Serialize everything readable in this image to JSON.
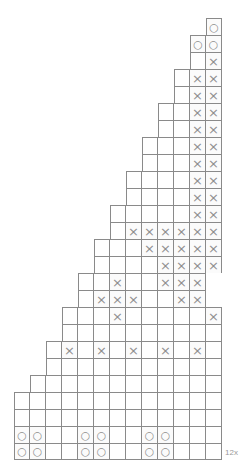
{
  "chart": {
    "title": "",
    "repeat_label": "12x",
    "columns": 13,
    "cell_px": 16,
    "row_px": 17,
    "grid_left_px": 14,
    "grid_top_px": 18,
    "colors": {
      "grid_line": "#8a8a8a",
      "symbol": "#8f8f8f",
      "label": "#9a9a9a",
      "background": "#ffffff",
      "shaded_cell": "#fbfbfb"
    },
    "symbol_legend": {
      "x": "cross-stitch-symbol",
      "o": "circle-stitch-symbol",
      "blank": "empty-cell"
    },
    "rows": [
      {
        "index": 26,
        "start_col": 12,
        "cells": [
          "o"
        ]
      },
      {
        "index": 25,
        "start_col": 11,
        "cells": [
          "o",
          "o"
        ]
      },
      {
        "index": 24,
        "start_col": 11,
        "cells": [
          "",
          "x"
        ]
      },
      {
        "index": 23,
        "start_col": 10,
        "cells": [
          "",
          "x",
          "x"
        ]
      },
      {
        "index": 22,
        "start_col": 10,
        "cells": [
          "",
          "x",
          "x"
        ]
      },
      {
        "index": 21,
        "start_col": 9,
        "cells": [
          "",
          "",
          "x",
          "x"
        ]
      },
      {
        "index": 20,
        "start_col": 9,
        "cells": [
          "",
          "",
          "x",
          "x"
        ]
      },
      {
        "index": 19,
        "start_col": 8,
        "cells": [
          "",
          "",
          "",
          "x",
          "x"
        ]
      },
      {
        "index": 18,
        "start_col": 8,
        "cells": [
          "",
          "",
          "",
          "x",
          "x"
        ]
      },
      {
        "index": 17,
        "start_col": 7,
        "cells": [
          "",
          "",
          "",
          "",
          "x",
          "x"
        ]
      },
      {
        "index": 16,
        "start_col": 7,
        "cells": [
          "",
          "",
          "",
          "",
          "x",
          "x"
        ]
      },
      {
        "index": 15,
        "start_col": 6,
        "cells": [
          "",
          "",
          "",
          "",
          "",
          "x",
          "x"
        ]
      },
      {
        "index": 14,
        "start_col": 6,
        "cells": [
          "",
          "x",
          "x",
          "x",
          "x",
          "x",
          "x"
        ]
      },
      {
        "index": 13,
        "start_col": 5,
        "cells": [
          "",
          "",
          "",
          "x",
          "x",
          "x",
          "x",
          "x"
        ]
      },
      {
        "index": 12,
        "start_col": 5,
        "cells": [
          "",
          "",
          "",
          "",
          "x",
          "x",
          "x",
          "x"
        ]
      },
      {
        "index": 11,
        "start_col": 4,
        "cells": [
          "",
          "",
          "x",
          "",
          "",
          "x",
          "x",
          "x"
        ]
      },
      {
        "index": 10,
        "start_col": 4,
        "cells": [
          "",
          "x",
          "x",
          "x",
          "",
          "",
          "x",
          "x"
        ]
      },
      {
        "index": 9,
        "start_col": 3,
        "cells": [
          "",
          "",
          "",
          "x",
          "",
          "",
          "",
          "",
          "",
          "x"
        ]
      },
      {
        "index": 8,
        "start_col": 3,
        "cells": [
          "",
          "",
          "",
          "",
          "",
          "",
          "",
          "",
          "",
          ""
        ]
      },
      {
        "index": 7,
        "start_col": 2,
        "cells": [
          "",
          "x",
          "",
          "x",
          "",
          "x",
          "",
          "x",
          "",
          "x",
          ""
        ]
      },
      {
        "index": 6,
        "start_col": 2,
        "cells": [
          "",
          "",
          "",
          "",
          "",
          "",
          "",
          "",
          "",
          "",
          ""
        ]
      },
      {
        "index": 5,
        "start_col": 1,
        "cells": [
          "",
          "",
          "",
          "",
          "",
          "",
          "",
          "",
          "",
          "",
          "",
          ""
        ]
      },
      {
        "index": 4,
        "start_col": 0,
        "cells": [
          "",
          "",
          "",
          "",
          "",
          "",
          "",
          "",
          "",
          "",
          "",
          "",
          ""
        ]
      },
      {
        "index": 3,
        "start_col": 0,
        "cells": [
          "",
          "",
          "",
          "",
          "",
          "",
          "",
          "",
          "",
          "",
          "",
          "",
          ""
        ]
      },
      {
        "index": 2,
        "start_col": 0,
        "cells": [
          "o",
          "o",
          "",
          "",
          "o",
          "o",
          "",
          "",
          "o",
          "o",
          "",
          "",
          ""
        ]
      },
      {
        "index": 1,
        "start_col": 0,
        "cells": [
          "o",
          "o",
          "",
          "",
          "o",
          "o",
          "",
          "",
          "o",
          "o",
          "",
          "",
          ""
        ]
      }
    ]
  }
}
